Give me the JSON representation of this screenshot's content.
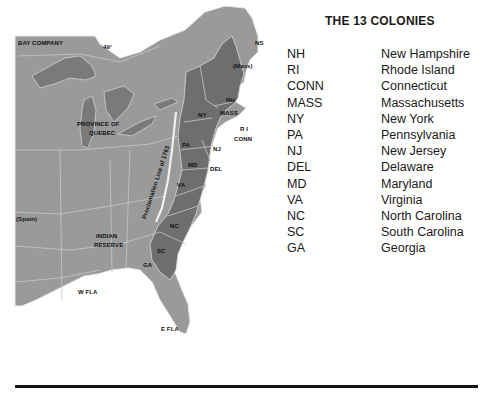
{
  "title": "THE 13 COLONIES",
  "legend": [
    {
      "abbr": "NH",
      "name": "New Hampshire"
    },
    {
      "abbr": "RI",
      "name": "Rhode Island"
    },
    {
      "abbr": "CONN",
      "name": "Connecticut"
    },
    {
      "abbr": "MASS",
      "name": "Massachusetts"
    },
    {
      "abbr": "NY",
      "name": "New York"
    },
    {
      "abbr": "PA",
      "name": "Pennsylvania"
    },
    {
      "abbr": "NJ",
      "name": "New Jersey"
    },
    {
      "abbr": "DEL",
      "name": "Delaware"
    },
    {
      "abbr": "MD",
      "name": "Maryland"
    },
    {
      "abbr": "VA",
      "name": "Virginia"
    },
    {
      "abbr": "NC",
      "name": "North Carolina"
    },
    {
      "abbr": "SC",
      "name": "South Carolina"
    },
    {
      "abbr": "GA",
      "name": "Georgia"
    }
  ],
  "map_labels": {
    "bay_company": "BAY COMPANY",
    "parallel": "49°",
    "ns": "NS",
    "mass_maine": "(Mass)",
    "nh": "NH",
    "mass": "MASS",
    "ny": "NY",
    "ri": "R I",
    "conn": "CONN",
    "pa": "PA",
    "nj": "NJ",
    "md": "MD",
    "del": "DEL",
    "va": "VA",
    "nc": "NC",
    "sc": "SC",
    "ga": "GA",
    "province_of_quebec_1": "PROVINCE OF",
    "province_of_quebec_2": "QUEBEC",
    "proclamation_line": "Proclamation Line of 1763",
    "spain": "(Spain)",
    "indian_reserve_1": "INDIAN",
    "indian_reserve_2": "RESERVE",
    "w_fla": "W FLA",
    "e_fla": "E FLA"
  },
  "colors": {
    "territory": "#9a9a9a",
    "colony": "#6e6e6e",
    "water": "#7c7c7c",
    "border": "#c8c8c8",
    "outline": "#e8e8e8"
  }
}
